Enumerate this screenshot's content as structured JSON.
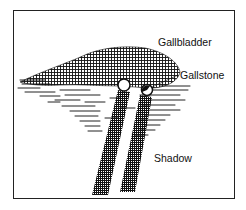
{
  "figure": {
    "type": "ultrasound schematic",
    "labels": {
      "gallbladder": "Gallbladder",
      "gallstone": "Gallstone",
      "shadow": "Shadow"
    },
    "colors": {
      "ink": "#111111",
      "background": "#ffffff"
    }
  }
}
